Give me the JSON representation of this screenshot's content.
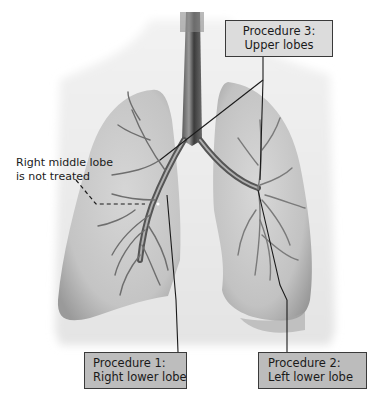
{
  "diagram": {
    "labels": {
      "procedure3": {
        "line1": "Procedure 3:",
        "line2": "Upper lobes",
        "fill": "#dcdcdc"
      },
      "procedure1": {
        "line1": "Procedure 1:",
        "line2": "Right lower lobe",
        "fill": "#bdbdbd"
      },
      "procedure2": {
        "line1": "Procedure 2:",
        "line2": "Left lower lobe",
        "fill": "#bcbcbc"
      }
    },
    "annotation": {
      "line1": "Right middle lobe",
      "line2": "is not treated",
      "leader_style": "dashed"
    },
    "colors": {
      "background": "#ffffff",
      "lung_fill": "#d9d9d9",
      "lung_shadow": "#a8a8a8",
      "airway": "#6e6e6e",
      "leader_line": "#1a1a1a",
      "box_border": "#3a3a3a"
    }
  }
}
